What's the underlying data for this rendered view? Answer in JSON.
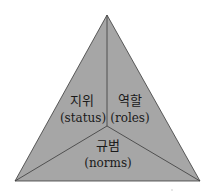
{
  "diagram": {
    "shape": "triangle",
    "fill_color": "#a6a6a6",
    "stroke_color": "#3a3a3a",
    "background": "#ffffff",
    "sections": [
      {
        "id": "status",
        "korean": "지위",
        "english": "(status)"
      },
      {
        "id": "roles",
        "korean": "역할",
        "english": "(roles)"
      },
      {
        "id": "norms",
        "korean": "규범",
        "english": "(norms)"
      }
    ]
  }
}
